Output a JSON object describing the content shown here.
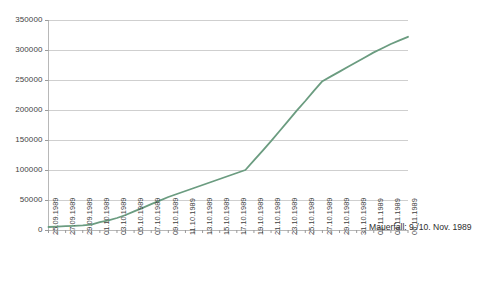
{
  "chart_data": {
    "type": "line",
    "title": "",
    "subtitle": "",
    "xlabel": "",
    "ylabel": "",
    "ylim": [
      0,
      350000
    ],
    "ytick_values": [
      0,
      50000,
      100000,
      150000,
      200000,
      250000,
      300000,
      350000
    ],
    "ytick_labels": [
      "0",
      "50000",
      "100000",
      "150000",
      "200000",
      "250000",
      "300000",
      "350000"
    ],
    "grid": "horizontal",
    "legend": "none",
    "line_color": "#6b9c80",
    "categories": [
      "25.09.1989",
      "26.09.1989",
      "27.09.1989",
      "28.09.1989",
      "29.09.1989",
      "30.09.1989",
      "01.10.1989",
      "02.10.1989",
      "03.10.1989",
      "04.10.1989",
      "05.10.1989",
      "06.10.1989",
      "07.10.1989",
      "08.10.1989",
      "09.10.1989",
      "10.10.1989",
      "11.10.1989",
      "12.10.1989",
      "13.10.1989",
      "14.10.1989",
      "15.10.1989",
      "16.10.1989",
      "17.10.1989",
      "18.10.1989",
      "19.10.1989",
      "20.10.1989",
      "21.10.1989",
      "22.10.1989",
      "23.10.1989",
      "24.10.1989",
      "25.10.1989",
      "26.10.1989",
      "27.10.1989",
      "28.10.1989",
      "29.10.1989",
      "30.10.1989",
      "31.10.1989",
      "01.11.1989",
      "02.11.1989",
      "03.11.1989",
      "04.11.1989",
      "05.11.1989",
      "06.11.1989"
    ],
    "xtick_labels": [
      "25.09.1989",
      "27.09.1989",
      "29.09.1989",
      "01.10.1989",
      "03.10.1989",
      "05.10.1989",
      "07.10.1989",
      "09.10.1989",
      "11.10.1989",
      "13.10.1989",
      "15.10.1989",
      "17.10.1989",
      "19.10.1989",
      "21.10.1989",
      "23.10.1989",
      "25.10.1989",
      "27.10.1989",
      "29.10.1989",
      "31.10.1989",
      "02.11.1989",
      "04.11.1989",
      "06.11.1989"
    ],
    "values": [
      5000,
      5600,
      6300,
      7000,
      7800,
      9000,
      13000,
      16000,
      20000,
      25000,
      31000,
      37000,
      43000,
      49000,
      55000,
      60000,
      65000,
      70000,
      75000,
      80000,
      85000,
      90000,
      95000,
      100000,
      116000,
      132000,
      148000,
      165000,
      182000,
      199000,
      215000,
      232000,
      248000,
      256000,
      264000,
      272000,
      280000,
      288000,
      296000,
      303000,
      310000,
      316000,
      322000
    ],
    "annotations": [
      {
        "text": "Mauerfall: 9./10. Nov. 1989",
        "x": 0.88,
        "y": 0.21
      }
    ]
  },
  "annotation_text": "Mauerfall: 9./10. Nov. 1989"
}
